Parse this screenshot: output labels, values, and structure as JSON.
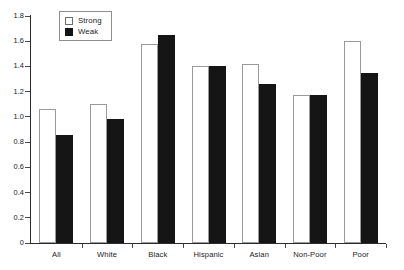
{
  "chart_data": {
    "type": "bar",
    "title": "",
    "subtitle": "",
    "xlabel": "",
    "ylabel": "",
    "categories": [
      "All",
      "White",
      "Black",
      "Hispanic",
      "Asian",
      "Non-Poor",
      "Poor"
    ],
    "series": [
      {
        "name": "Strong",
        "color": "#ffffff",
        "values": [
          1.06,
          1.1,
          1.58,
          1.4,
          1.42,
          1.17,
          1.6
        ]
      },
      {
        "name": "Weak",
        "color": "#151515",
        "values": [
          0.86,
          0.98,
          1.65,
          1.4,
          1.26,
          1.17,
          1.35
        ]
      }
    ],
    "ylim": [
      0,
      1.8
    ],
    "ytick_labels": [
      "0",
      "0.2",
      "0.4",
      "0.6",
      "0.8",
      "1.0",
      "1.2",
      "1.4",
      "1.6",
      "1.8"
    ],
    "ytick_values": [
      0,
      0.2,
      0.4,
      0.6,
      0.8,
      1.0,
      1.2,
      1.4,
      1.6,
      1.8
    ],
    "grid": false,
    "legend_position": "top-left",
    "annotations": []
  },
  "legend": {
    "items": [
      {
        "label": "Strong",
        "swatch": "open-square-swatch"
      },
      {
        "label": "Weak",
        "swatch": "filled-square-swatch"
      }
    ]
  }
}
